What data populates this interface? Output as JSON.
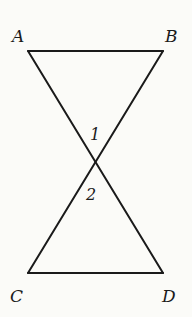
{
  "diagram": {
    "type": "geometry",
    "points": {
      "A": {
        "label": "A",
        "x": 28,
        "y": 51
      },
      "B": {
        "label": "B",
        "x": 163,
        "y": 51
      },
      "C": {
        "label": "C",
        "x": 28,
        "y": 273
      },
      "D": {
        "label": "D",
        "x": 163,
        "y": 273
      },
      "O": {
        "label": "",
        "x": 96,
        "y": 160
      }
    },
    "segments": [
      {
        "from": "A",
        "to": "B"
      },
      {
        "from": "A",
        "to": "D"
      },
      {
        "from": "B",
        "to": "C"
      },
      {
        "from": "C",
        "to": "D"
      }
    ],
    "angles": [
      {
        "label": "1",
        "position": "above intersection"
      },
      {
        "label": "2",
        "position": "below intersection"
      }
    ]
  },
  "labels": {
    "A": "A",
    "B": "B",
    "C": "C",
    "D": "D",
    "angle1": "1",
    "angle2": "2"
  }
}
